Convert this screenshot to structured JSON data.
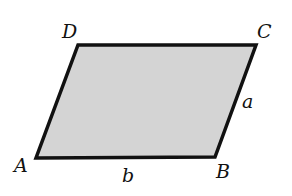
{
  "diagram": {
    "type": "parallelogram",
    "fill_color": "#d4d4d4",
    "stroke_color": "#111111",
    "vertices": [
      {
        "name": "A",
        "x": 36,
        "y": 158
      },
      {
        "name": "B",
        "x": 215,
        "y": 157
      },
      {
        "name": "C",
        "x": 256,
        "y": 45
      },
      {
        "name": "D",
        "x": 78,
        "y": 45
      }
    ],
    "labels": {
      "A": "A",
      "B": "B",
      "C": "C",
      "D": "D",
      "side_a": "a",
      "side_b": "b"
    }
  }
}
